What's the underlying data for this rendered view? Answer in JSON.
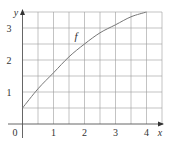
{
  "chart_data": {
    "type": "line",
    "title": "",
    "xlabel": "x",
    "ylabel": "y",
    "x_ticks": [
      "0",
      "1",
      "2",
      "3",
      "4"
    ],
    "y_ticks": [
      "1",
      "2",
      "3"
    ],
    "xlim": [
      0,
      4.5
    ],
    "ylim": [
      0,
      3.5
    ],
    "grid": true,
    "grid_step": 0.5,
    "series": [
      {
        "name": "f",
        "x": [
          0,
          0.5,
          1,
          1.5,
          2,
          2.5,
          3,
          3.5,
          4
        ],
        "values": [
          0.5,
          1.1,
          1.6,
          2.1,
          2.5,
          2.85,
          3.1,
          3.35,
          3.5
        ]
      }
    ],
    "annotations": [
      {
        "text": "f",
        "x": 1.7,
        "y": 2.7
      }
    ]
  },
  "labels": {
    "origin": "0",
    "x_axis": "x",
    "y_axis": "y",
    "x1": "1",
    "x2": "2",
    "x3": "3",
    "x4": "4",
    "y1": "1",
    "y2": "2",
    "y3": "3",
    "curve": "f"
  }
}
